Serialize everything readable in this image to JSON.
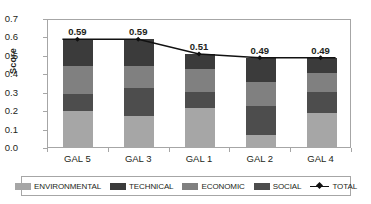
{
  "chart_data": {
    "type": "bar",
    "subtype": "stacked-bar-with-line-overlay",
    "title": "",
    "xlabel": "",
    "ylabel": "Score",
    "ylim": [
      0.0,
      0.7
    ],
    "ytick_step": 0.1,
    "yticks": [
      "0.7",
      "0.6",
      "0.5",
      "0.4",
      "0.3",
      "0.2",
      "0.1",
      "0.0"
    ],
    "grid": false,
    "legend_position": "bottom",
    "categories": [
      "GAL 5",
      "GAL 3",
      "GAL 1",
      "GAL 2",
      "GAL 4"
    ],
    "series": [
      {
        "name": "ENVIRONMENTAL",
        "color": "#a6a6a6",
        "values": [
          0.195,
          0.17,
          0.21,
          0.065,
          0.185
        ]
      },
      {
        "name": "SOCIAL",
        "color": "#4d4d4d",
        "values": [
          0.095,
          0.15,
          0.09,
          0.155,
          0.115
        ]
      },
      {
        "name": "ECONOMIC",
        "color": "#808080",
        "values": [
          0.15,
          0.12,
          0.125,
          0.135,
          0.1
        ]
      },
      {
        "name": "TECHNICAL",
        "color": "#3b3b3b",
        "values": [
          0.145,
          0.145,
          0.08,
          0.13,
          0.085
        ]
      }
    ],
    "stack_order_bottom_to_top": [
      "ENVIRONMENTAL",
      "SOCIAL",
      "ECONOMIC",
      "TECHNICAL"
    ],
    "line_series": {
      "name": "TOTAL",
      "color": "#111111",
      "marker": "diamond",
      "values": [
        0.59,
        0.59,
        0.51,
        0.49,
        0.49
      ],
      "labels": [
        "0.59",
        "0.59",
        "0.51",
        "0.49",
        "0.49"
      ]
    }
  },
  "legend": {
    "items": [
      {
        "label": "ENVIRONMENTAL",
        "color": "#a6a6a6",
        "type": "swatch"
      },
      {
        "label": "TECHNICAL",
        "color": "#3b3b3b",
        "type": "swatch"
      },
      {
        "label": "ECONOMIC",
        "color": "#808080",
        "type": "swatch"
      },
      {
        "label": "SOCIAL",
        "color": "#4d4d4d",
        "type": "swatch"
      },
      {
        "label": "TOTAL",
        "color": "#111111",
        "type": "line-marker"
      }
    ]
  },
  "axis": {
    "y_title": "Score",
    "frame_color": "#a6a6a6"
  }
}
